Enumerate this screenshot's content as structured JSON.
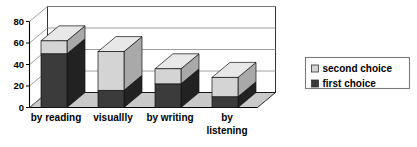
{
  "chart_data": {
    "type": "bar",
    "subtype": "stacked-3d-column",
    "title": "",
    "subtitle": "",
    "xlabel": "",
    "ylabel": "",
    "categories": [
      "by reading",
      "visuallly",
      "by writing",
      "by listening"
    ],
    "category_lines": [
      [
        "by reading"
      ],
      [
        "visuallly"
      ],
      [
        "by writing"
      ],
      [
        "by",
        "listening"
      ]
    ],
    "series": [
      {
        "name": "first choice",
        "color": "#3b3b3b",
        "values": [
          50,
          16,
          22,
          10
        ]
      },
      {
        "name": "second choice",
        "color": "#d4d4d4",
        "values": [
          12,
          36,
          14,
          18
        ]
      }
    ],
    "totals": [
      62,
      52,
      36,
      28
    ],
    "ylim": [
      0,
      80
    ],
    "yticks": [
      0,
      20,
      40,
      60,
      80
    ],
    "ytick_labels": [
      "0",
      "20",
      "40",
      "60",
      "80"
    ],
    "grid": true,
    "grid_axis": "y",
    "legend": {
      "position": "right",
      "entries": [
        {
          "label": "second choice",
          "swatch": "#d4d4d4"
        },
        {
          "label": "first choice",
          "swatch": "#3b3b3b"
        }
      ]
    },
    "colors": {
      "bar_first_front": "#3b3b3b",
      "bar_first_top": "#555555",
      "bar_first_side": "#222222",
      "bar_second_front": "#d4d4d4",
      "bar_second_top": "#e8e8e8",
      "bar_second_side": "#a9a9a9",
      "floor": "#c9c9c9",
      "wall": "#ffffff",
      "axis": "#000000",
      "grid": "#888888",
      "legend_border": "#7a7a7a",
      "background": "#ffffff"
    }
  }
}
